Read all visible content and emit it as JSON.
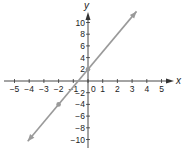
{
  "chart_data": {
    "type": "line",
    "title": "",
    "xlabel": "x",
    "ylabel": "y",
    "xlim": [
      -5,
      5
    ],
    "ylim": [
      -10,
      10
    ],
    "x_ticks": [
      "-5",
      "-4",
      "-3",
      "-2",
      "-1",
      "0",
      "1",
      "2",
      "3",
      "4",
      "5"
    ],
    "y_ticks": [
      "10",
      "8",
      "6",
      "4",
      "2",
      "-2",
      "-4",
      "-6",
      "-8",
      "-10"
    ],
    "grid": false,
    "series": [
      {
        "name": "line",
        "equation": "y = 3x + 2",
        "points": [
          {
            "x": -2,
            "y": -4
          },
          {
            "x": 0,
            "y": 2
          }
        ],
        "color": "#9a9a9a",
        "arrows": "both"
      }
    ]
  }
}
